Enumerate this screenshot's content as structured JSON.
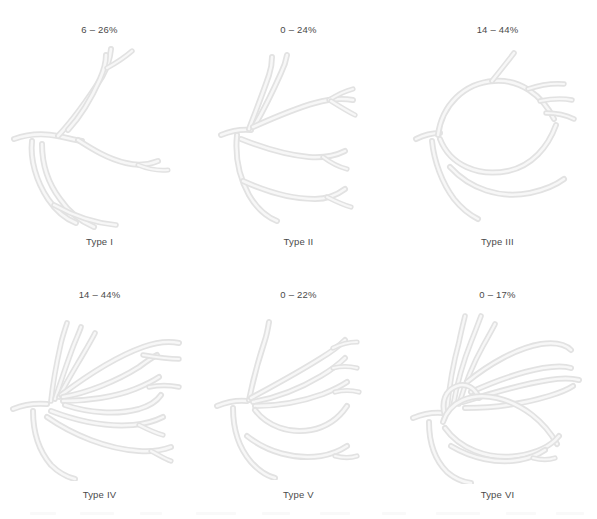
{
  "figure": {
    "columns": 3,
    "rows": 2,
    "line_color": "#e2e2e2",
    "text_color": "#4a4a4a",
    "background": "#ffffff"
  },
  "panels": [
    {
      "id": "type-1",
      "percentage": "6 – 26%",
      "type_label": "Type I",
      "row": 1,
      "column": 1
    },
    {
      "id": "type-2",
      "percentage": "0 – 24%",
      "type_label": "Type II",
      "row": 1,
      "column": 2
    },
    {
      "id": "type-3",
      "percentage": "14 – 44%",
      "type_label": "Type III",
      "row": 1,
      "column": 3
    },
    {
      "id": "type-4",
      "percentage": "14 – 44%",
      "type_label": "Type IV",
      "row": 2,
      "column": 1
    },
    {
      "id": "type-5",
      "percentage": "0 – 22%",
      "type_label": "Type V",
      "row": 2,
      "column": 2
    },
    {
      "id": "type-6",
      "percentage": "0 – 17%",
      "type_label": "Type VI",
      "row": 2,
      "column": 3
    }
  ]
}
